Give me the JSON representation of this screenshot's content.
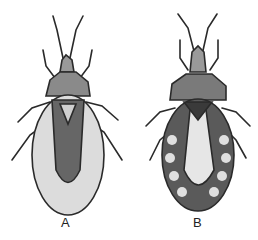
{
  "figure": {
    "panels": [
      {
        "id": "A",
        "label": "A",
        "subject": "insect-dorsal-view-light-abdomen"
      },
      {
        "id": "B",
        "label": "B",
        "subject": "insect-dorsal-view-spotted-abdomen"
      }
    ],
    "colors": {
      "ink": "#2a2a2a",
      "light_fill": "#d8d8d8",
      "dark_fill": "#555555",
      "background": "#ffffff"
    }
  }
}
